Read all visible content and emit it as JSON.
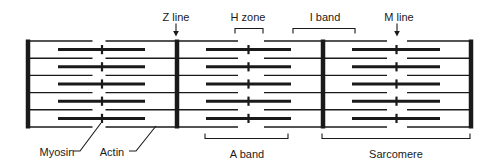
{
  "figure": {
    "name": "sarcomere-structure-diagram",
    "canvas": {
      "width": 499,
      "height": 168
    },
    "colors": {
      "ink": "#1a1a1a",
      "background": "#ffffff"
    }
  },
  "structure": {
    "bar_top": 39.5,
    "bar_bottom": 128.5,
    "thin_row_ys": [
      41,
      58.2,
      75.4,
      92.6,
      109.8,
      127
    ],
    "thick_row_ys": [
      49.6,
      66.8,
      84,
      101.2,
      118.4
    ],
    "z_lines_x": [
      28,
      177,
      323,
      471
    ],
    "segments": [
      {
        "x1": 28,
        "x2": 177,
        "myosin_x1": 58,
        "myosin_x2": 145,
        "center": 102,
        "gap_x1": 92.5,
        "gap_x2": 105.5
      },
      {
        "x1": 177,
        "x2": 323,
        "myosin_x1": 206,
        "myosin_x2": 291,
        "center": 248.5,
        "gap_x1": 238,
        "gap_x2": 264
      },
      {
        "x1": 323,
        "x2": 471,
        "myosin_x1": 352,
        "myosin_x2": 440,
        "center": 396.5,
        "gap_x1": 387,
        "gap_x2": 407
      }
    ]
  },
  "labels": {
    "z_line": {
      "text": "Z line",
      "cx": 176,
      "cy": 16.5,
      "arrow_x": 176
    },
    "h_zone": {
      "text": "H zone",
      "cx": 248,
      "cy": 16.5,
      "bracket_x1": 235,
      "bracket_x2": 263
    },
    "i_band": {
      "text": "I band",
      "cx": 325,
      "cy": 16.5,
      "bracket_x1": 293,
      "bracket_x2": 355
    },
    "m_line": {
      "text": "M line",
      "cx": 399,
      "cy": 16.5,
      "arrow_x": 397
    },
    "myosin": {
      "text": "Myosin",
      "cx": 57,
      "cy": 151.5,
      "leader": [
        [
          73,
          151
        ],
        [
          80,
          151
        ],
        [
          101,
          123
        ]
      ]
    },
    "actin": {
      "text": "Actin",
      "cx": 112,
      "cy": 151.5,
      "leader": [
        [
          129,
          151
        ],
        [
          136,
          151
        ],
        [
          156,
          126
        ]
      ]
    },
    "a_band": {
      "text": "A band",
      "cx": 247,
      "cy": 154,
      "bracket_x1": 205,
      "bracket_x2": 288
    },
    "sarcomere": {
      "text": "Sarcomere",
      "cx": 396,
      "cy": 154,
      "bracket_x1": 322,
      "bracket_x2": 470
    }
  },
  "geometry": {
    "top_bracket_y": 28.5,
    "top_bracket_tick": 5,
    "bottom_bracket_y": 138.5,
    "bottom_bracket_tick": 5,
    "arrow_top_y": 23.5,
    "arrow_shaft_bottom_y": 31.5,
    "arrow_tip_y": 36.5,
    "arrow_half_width": 2.8
  }
}
